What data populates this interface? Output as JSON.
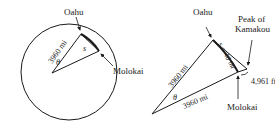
{
  "left_diagram": {
    "labels": {
      "oahu": "Oahu",
      "molokai": "Molokai",
      "radius": "3960 mi",
      "arc": "s",
      "angle": "θ"
    }
  },
  "right_diagram": {
    "labels": {
      "oahu": "Oahu",
      "peak_line1": "Peak of",
      "peak_line2": "Kamakou",
      "arc": "s = 40 mi",
      "radius_upper": "3960 mi",
      "radius_lower": "3960 mi",
      "angle": "θ",
      "height": "4,961 ft",
      "molokai": "Molokai"
    }
  },
  "colors": {
    "stroke": "#1a1a1a",
    "text": "#222222",
    "background": "#ffffff"
  }
}
